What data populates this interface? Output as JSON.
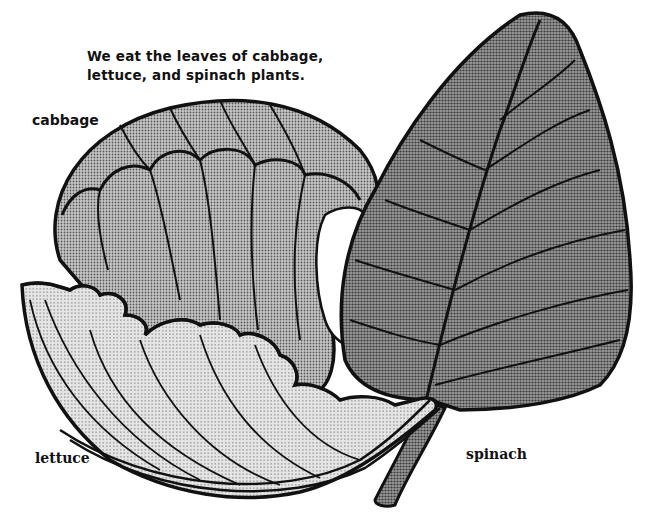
{
  "diagram": {
    "caption_lines": [
      "We eat the leaves of cabbage,",
      "lettuce, and spinach plants."
    ],
    "labels": {
      "cabbage": "cabbage",
      "lettuce": "lettuce",
      "spinach": "spinach"
    },
    "illustrations": [
      {
        "name": "cabbage-leaf",
        "fill": "medium halftone gray"
      },
      {
        "name": "lettuce-leaf",
        "fill": "light halftone gray"
      },
      {
        "name": "spinach-leaf",
        "fill": "dark halftone gray"
      }
    ],
    "colors": {
      "ink": "#111111",
      "background": "#ffffff",
      "cabbage_fill": "#a8a8a8",
      "lettuce_fill": "#d4d4d4",
      "spinach_fill": "#7e7e7e"
    }
  }
}
